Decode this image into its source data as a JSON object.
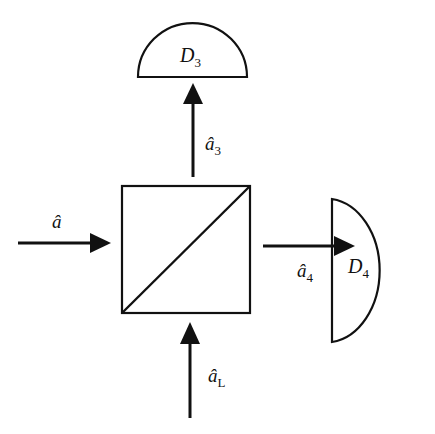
{
  "diagram": {
    "type": "beam-splitter",
    "stroke_color": "#111111",
    "input_mode": {
      "symbol": "â",
      "base": "a"
    },
    "local_oscillator": {
      "symbol": "â",
      "base": "a",
      "subscript": "L"
    },
    "output_3": {
      "symbol": "â",
      "base": "a",
      "subscript": "3"
    },
    "output_4": {
      "symbol": "â",
      "base": "a",
      "subscript": "4"
    },
    "detector_3": {
      "base": "D",
      "subscript": "3"
    },
    "detector_4": {
      "base": "D",
      "subscript": "4"
    }
  }
}
